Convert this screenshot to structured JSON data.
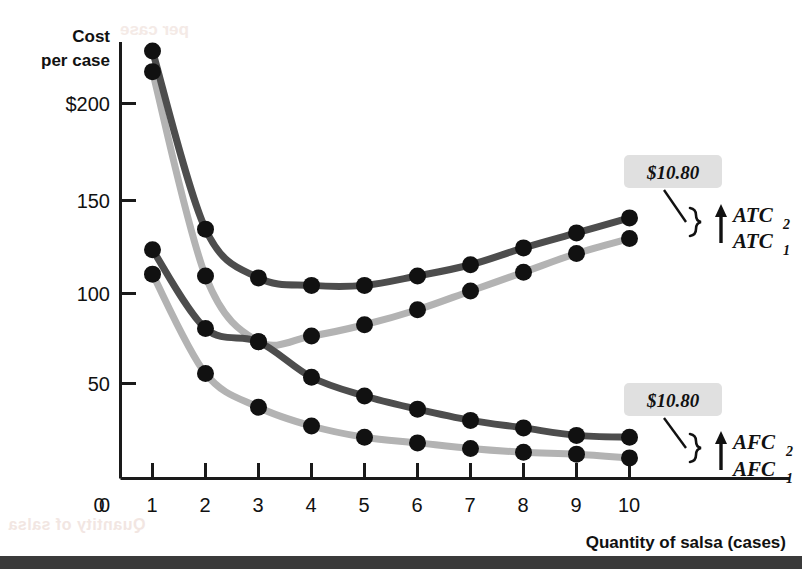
{
  "chart_data": {
    "type": "line",
    "title": "",
    "xlabel": "Quantity of salsa (cases)",
    "ylabel": "Cost per case",
    "x": [
      1,
      2,
      3,
      4,
      5,
      6,
      7,
      8,
      9,
      10
    ],
    "xlim": [
      0,
      10.6
    ],
    "ylim": [
      0,
      235
    ],
    "grid": false,
    "legend_position": "right-inline",
    "xticks": [
      "0",
      "1",
      "2",
      "3",
      "4",
      "5",
      "6",
      "7",
      "8",
      "9",
      "10"
    ],
    "yticks": [
      "0",
      "50",
      "100",
      "150",
      "$200"
    ],
    "ytick_values": [
      0,
      50,
      100,
      150,
      200
    ],
    "series": [
      {
        "name": "ATC2",
        "label": "ATC",
        "subscript": "2",
        "color": "#4d4d4d",
        "values": [
          228,
          133,
          107,
          103,
          103,
          108,
          114,
          123,
          131,
          139
        ]
      },
      {
        "name": "ATC1",
        "label": "ATC",
        "subscript": "1",
        "color": "#b3b3b3",
        "values": [
          217,
          108,
          73,
          76,
          82,
          90,
          100,
          110,
          120,
          128
        ]
      },
      {
        "name": "AFC2",
        "label": "AFC",
        "subscript": "2",
        "color": "#4d4d4d",
        "values": [
          122,
          80,
          73,
          54,
          44,
          37,
          31,
          27,
          23,
          22
        ]
      },
      {
        "name": "AFC1",
        "label": "AFC",
        "subscript": "1",
        "color": "#b3b3b3",
        "values": [
          109,
          56,
          38,
          28,
          22,
          19,
          16,
          14,
          13,
          11
        ]
      }
    ],
    "annotations": [
      {
        "name": "atc-gap-callout",
        "text": "$10.80",
        "describes": "vertical gap between ATC1 and ATC2 at quantity 10",
        "value": 10.8
      },
      {
        "name": "afc-gap-callout",
        "text": "$10.80",
        "describes": "vertical gap between AFC1 and AFC2 at quantity 10",
        "value": 10.8
      }
    ]
  },
  "colors": {
    "dark_curve": "#4d4d4d",
    "light_curve": "#b3b3b3",
    "marker": "#111111",
    "axis": "#1a1a1a",
    "callout_background": "#e0e0e0",
    "bottom_bar": "#3a3a3a"
  },
  "axis": {
    "y_title_line1": "Cost",
    "y_title_line2": "per case",
    "x_title": "Quantity of salsa (cases)"
  },
  "bleed_through": {
    "bottom_left": "Quantity of salsa",
    "top": "per case"
  }
}
